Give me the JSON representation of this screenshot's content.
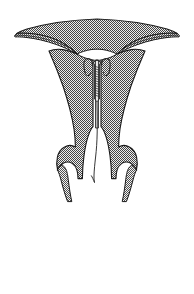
{
  "figure": {
    "title": "Uterus with intrauterine device (IUD) in situ",
    "view": "coronal section",
    "background_color": "#ffffff",
    "canvas": {
      "width": 194,
      "height": 294
    }
  },
  "style": {
    "outline_color": "#1a1a1a",
    "outline_width": 1.1,
    "myometrium_fill": "#a8a8a8",
    "myometrium_pattern": "checker-dither",
    "pattern_dark": "#4d4d4d",
    "pattern_light": "#e6e6e6",
    "cavity_fill": "#ffffff",
    "device_color": "#2b2b2b",
    "device_width": 1.0
  },
  "structures": [
    {
      "id": "fundus",
      "label": "Uterine fundus",
      "description": "Broad domed superior body of the uterus"
    },
    {
      "id": "myometrium-left",
      "label": "Left uterine wall (myometrium)",
      "description": "Thick stippled muscular wall tapering inferiorly"
    },
    {
      "id": "myometrium-right",
      "label": "Right uterine wall (myometrium)",
      "description": "Thick stippled muscular wall tapering inferiorly"
    },
    {
      "id": "fallopian-tube-left",
      "label": "Left fallopian tube and broad ligament",
      "description": "Narrow tapering band extending to the left margin"
    },
    {
      "id": "fallopian-tube-right",
      "label": "Right fallopian tube and broad ligament",
      "description": "Narrow tapering band extending to the right margin"
    },
    {
      "id": "endometrial-cavity",
      "label": "Endometrial cavity",
      "description": "Inverted triangular white cavity between uterine walls"
    },
    {
      "id": "cervical-canal",
      "label": "Cervical canal",
      "description": "Narrow channel from internal os to external os"
    },
    {
      "id": "cervix",
      "label": "Cervix",
      "description": "Lower constricted uterine segment with lateral fornices"
    },
    {
      "id": "vaginal-wall-left",
      "label": "Left vaginal wall",
      "description": "Thin stippled band descending from the left fornix"
    },
    {
      "id": "vaginal-wall-right",
      "label": "Right vaginal wall",
      "description": "Thin stippled band descending from the right fornix"
    }
  ],
  "device": {
    "id": "iud",
    "label": "Intrauterine device (IUD)",
    "parts": [
      {
        "id": "iud-arms",
        "label": "IUD lateral arms",
        "description": "Paired outward-flaring arms seated against the fundus"
      },
      {
        "id": "iud-stem",
        "label": "IUD vertical stem",
        "description": "Coiled copper-wound stem descending in the cavity midline"
      },
      {
        "id": "iud-string",
        "label": "IUD retrieval string",
        "description": "Fine monofilament thread passing through the cervical canal into the vagina"
      }
    ]
  }
}
